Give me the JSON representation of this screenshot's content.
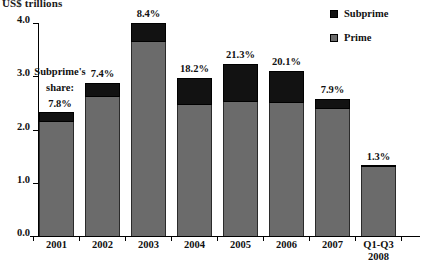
{
  "chart_data": {
    "type": "bar",
    "title": "US$ trillions",
    "subtitle": "",
    "xlabel": "",
    "ylabel": "US$ trillions",
    "ylim": [
      0.0,
      4.0
    ],
    "yticks": [
      "0.0",
      "1.0",
      "2.0",
      "3.0",
      "4.0"
    ],
    "grid": false,
    "stacked": true,
    "legend_position": "top-right",
    "legend": [
      "Subprime",
      "Prime"
    ],
    "categories": [
      "2001",
      "2002",
      "2003",
      "2004",
      "2005",
      "2006",
      "2007",
      "Q1-Q3 2008"
    ],
    "series": [
      {
        "name": "Prime",
        "color": "#6b6b6b",
        "values": [
          2.14,
          2.61,
          3.64,
          2.46,
          2.52,
          2.5,
          2.39,
          1.29
        ]
      },
      {
        "name": "Subprime",
        "color": "#121212",
        "values": [
          0.19,
          0.26,
          0.36,
          0.51,
          0.71,
          0.6,
          0.18,
          0.02
        ]
      }
    ],
    "totals": [
      2.33,
      2.87,
      4.0,
      2.97,
      3.23,
      3.1,
      2.57,
      1.31
    ],
    "data_labels": [
      "7.8%",
      "7.4%",
      "8.4%",
      "18.2%",
      "21.3%",
      "20.1%",
      "7.9%",
      "1.3%"
    ],
    "annotation": {
      "line1": "Subprime's",
      "line2": "share:"
    }
  },
  "axis": {
    "title": "US$ trillions",
    "ticks": [
      {
        "label": "4.0",
        "value": 4.0
      },
      {
        "label": "3.0",
        "value": 3.0
      },
      {
        "label": "2.0",
        "value": 2.0
      },
      {
        "label": "1.0",
        "value": 1.0
      },
      {
        "label": "0.0",
        "value": 0.0
      }
    ]
  },
  "categories": [
    {
      "line1": "2001",
      "line2": ""
    },
    {
      "line1": "2002",
      "line2": ""
    },
    {
      "line1": "2003",
      "line2": ""
    },
    {
      "line1": "2004",
      "line2": ""
    },
    {
      "line1": "2005",
      "line2": ""
    },
    {
      "line1": "2006",
      "line2": ""
    },
    {
      "line1": "2007",
      "line2": ""
    },
    {
      "line1": "Q1-Q3",
      "line2": "2008"
    }
  ],
  "legend": {
    "subprime_label": "Subprime",
    "prime_label": "Prime",
    "subprime_color": "#121212",
    "prime_color": "#6b6b6b"
  }
}
